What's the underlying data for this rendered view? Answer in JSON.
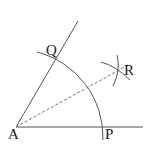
{
  "diagram": {
    "stroke_color": "#333333",
    "points": {
      "A": {
        "label": "A",
        "x": 16,
        "y": 127
      },
      "P": {
        "label": "P",
        "x": 103,
        "y": 127
      },
      "Q": {
        "label": "Q",
        "x": 57,
        "y": 59
      },
      "R": {
        "label": "R",
        "x": 117,
        "y": 71
      }
    },
    "labels": {
      "A": "A",
      "P": "P",
      "Q": "Q",
      "R": "R"
    },
    "elements": [
      {
        "type": "ray",
        "from": "A",
        "direction": "horizontal",
        "style": "solid"
      },
      {
        "type": "ray",
        "from": "A",
        "through": "Q",
        "style": "solid"
      },
      {
        "type": "arc",
        "center": "A",
        "through": [
          "Q",
          "P"
        ],
        "style": "solid"
      },
      {
        "type": "arc",
        "center": "Q",
        "near": "R",
        "style": "solid"
      },
      {
        "type": "arc",
        "center": "P",
        "near": "R",
        "style": "solid"
      },
      {
        "type": "segment",
        "from": "A",
        "to": "R",
        "style": "dashed"
      }
    ]
  }
}
